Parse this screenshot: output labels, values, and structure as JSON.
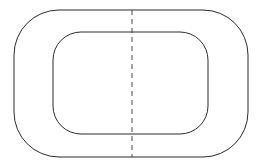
{
  "document": {
    "type": "technical-line-drawing",
    "title": "",
    "background_color": "#ffffff",
    "width": 262,
    "height": 168
  },
  "style": {
    "outline_color": "#2b2b2b",
    "outline_width": 1,
    "centerline_color": "#4a4a4a",
    "centerline_width": 1,
    "centerline_dash": "5 4",
    "fill": "none"
  },
  "shapes": {
    "outer_contour": {
      "name": "outer-rounded-rectangle",
      "x": 14,
      "y": 10,
      "width": 234,
      "height": 147,
      "corner_radius": 45
    },
    "inner_contour": {
      "name": "inner-rounded-rectangle",
      "x": 53,
      "y": 32,
      "width": 155,
      "height": 102,
      "corner_radius": 28
    },
    "centerline": {
      "name": "vertical-centerline",
      "x": 132,
      "y_start": 10,
      "y_end": 157
    }
  }
}
